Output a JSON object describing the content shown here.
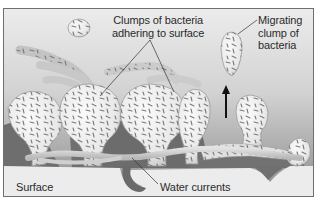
{
  "diagram": {
    "type": "biofilm-illustration",
    "labels": {
      "clumps_line1": "Clumps of bacteria",
      "clumps_line2": "adhering to surface",
      "migrating_line1": "Migrating",
      "migrating_line2": "clump of",
      "migrating_line3": "bacteria",
      "surface": "Surface",
      "water_currents": "Water currents"
    },
    "colors": {
      "background_top": "#e6e6e6",
      "background_bottom": "#8a8a8a",
      "surface": "#ececec",
      "clump_fill": "#f2f2f2",
      "clump_outline": "#9a9a9a",
      "bacteria": "#7a7a7a",
      "channel": "#cfcfcf",
      "void": "#6e6e6e",
      "frame": "#6f6f6f",
      "arrow": "#111111",
      "leader_line": "#333333"
    },
    "arrow": {
      "direction": "up",
      "meaning": "migration"
    }
  }
}
